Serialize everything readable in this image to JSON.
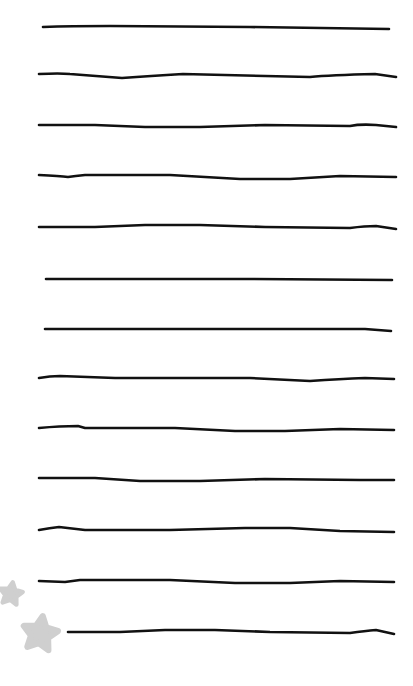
{
  "page": {
    "background": "#ffffff",
    "width": 413,
    "height": 686
  },
  "ink_color": "#111111",
  "star_color": "#cfcfcf",
  "lines": [
    {
      "d": "M43,27 Q70,26 110,26 L250,27 L389,29"
    },
    {
      "d": "M39,74 Q60,73 70,74 L122,78 Q150,76 183,74 L310,77 Q330,75 375,74 L396,77"
    },
    {
      "d": "M39,125 L95,125 L145,127 L200,127 L265,125 L350,126 Q360,124 376,125 L396,127"
    },
    {
      "d": "M39,175 Q60,176 68,177 Q75,176 85,175 L170,175 L240,179 L290,179 L340,176 L396,177"
    },
    {
      "d": "M39,227 L95,227 L145,225 L200,225 L265,227 L350,228 Q365,226 376,226 L396,229"
    },
    {
      "d": "M46,279 L250,279 L392,280"
    },
    {
      "d": "M45,329 L250,329 L365,329 L391,331"
    },
    {
      "d": "M39,378 Q50,376 60,376 L115,378 L250,378 L310,381 Q340,379 365,378 L394,379"
    },
    {
      "d": "M39,428 Q60,426 78,426 L85,428 L175,428 L235,431 L285,431 L340,429 L394,430"
    },
    {
      "d": "M39,478 L95,478 L140,481 L200,481 L265,479 L360,480 L394,480"
    },
    {
      "d": "M39,530 Q50,528 59,527 L85,530 L170,530 L245,528 L290,528 L340,531 L394,532"
    },
    {
      "d": "M39,581 L65,582 L80,580 L170,580 L235,583 L290,583 L340,581 L394,582"
    },
    {
      "d": "M68,632 L120,632 L165,630 L215,630 L270,632 L350,633 Q365,631 376,630 L394,634"
    }
  ],
  "stars": [
    {
      "name": "small-star",
      "cx": 11,
      "cy": 594,
      "r": 12
    },
    {
      "name": "large-star",
      "cx": 40,
      "cy": 634,
      "r": 18
    }
  ]
}
